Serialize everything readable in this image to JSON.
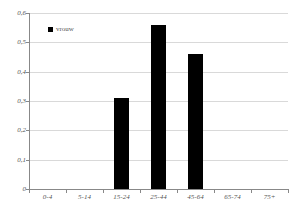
{
  "chart_data": {
    "type": "bar",
    "title": "",
    "xlabel": "",
    "ylabel": "",
    "categories": [
      "0-4",
      "5-14",
      "15-24",
      "25-44",
      "45-64",
      "65-74",
      "75+"
    ],
    "series": [
      {
        "name": "vrouw",
        "color": "#000000",
        "values": [
          null,
          null,
          0.31,
          0.56,
          0.46,
          null,
          null
        ]
      }
    ],
    "ylim": [
      0,
      0.6
    ],
    "ytick_step": 0.1,
    "ytick_labels": [
      "0",
      "0,1",
      "0,2",
      "0,3",
      "0,4",
      "0,5",
      "0,6"
    ],
    "grid": true,
    "legend_position": "top-left"
  },
  "colors": {
    "bar": "#000000",
    "gridline": "#d9d9d9",
    "axis": "#888888",
    "text": "#555555",
    "background": "#ffffff"
  }
}
